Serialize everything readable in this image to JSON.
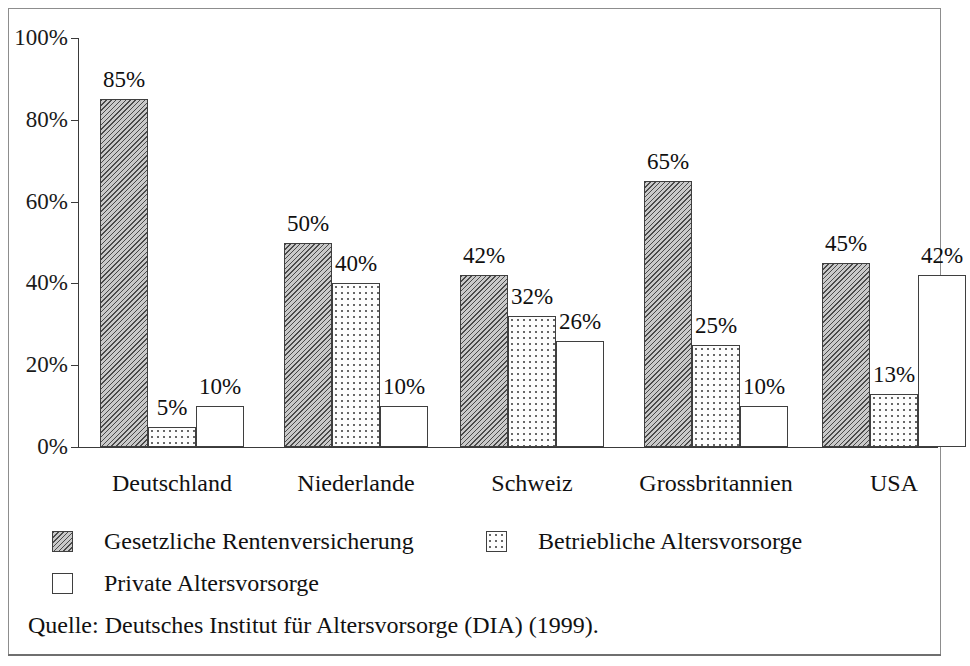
{
  "chart_data": {
    "type": "bar",
    "title": "",
    "subtitle": "",
    "xlabel": "",
    "ylabel": "",
    "ylim": [
      0,
      100
    ],
    "grid": false,
    "legend_position": "bottom",
    "value_suffix": "%",
    "categories": [
      "Deutschland",
      "Niederlande",
      "Schweiz",
      "Grossbritannien",
      "USA"
    ],
    "series": [
      {
        "name": "Gesetzliche Rentenversicherung",
        "pattern": "hatch",
        "values": [
          85,
          50,
          42,
          65,
          45
        ],
        "labels": [
          "85%",
          "50%",
          "42%",
          "65%",
          "45%"
        ]
      },
      {
        "name": "Betriebliche Altersvorsorge",
        "pattern": "dots",
        "values": [
          5,
          40,
          32,
          25,
          13
        ],
        "labels": [
          "5%",
          "40%",
          "32%",
          "25%",
          "13%"
        ]
      },
      {
        "name": "Private Altersvorsorge",
        "pattern": "plain",
        "values": [
          10,
          10,
          26,
          10,
          42
        ],
        "labels": [
          "10%",
          "10%",
          "26%",
          "10%",
          "42%"
        ]
      }
    ],
    "y_ticks": [
      0,
      20,
      40,
      60,
      80,
      100
    ],
    "y_tick_labels": [
      "0%",
      "20%",
      "40%",
      "60%",
      "80%",
      "100%"
    ],
    "source": "Quelle: Deutsches Institut für Altersvorsorge (DIA) (1999)."
  },
  "legend": {
    "entries": [
      {
        "label": "Gesetzliche Rentenversicherung",
        "pattern": "hatch"
      },
      {
        "label": "Betriebliche Altersvorsorge",
        "pattern": "dots"
      },
      {
        "label": "Private Altersvorsorge",
        "pattern": "plain"
      }
    ]
  },
  "colors": {
    "axis": "#3a3a3a",
    "frame": "#8d8d8d",
    "text": "#111111",
    "hatch_fill": "#c9c9c9",
    "hatch_line": "#4a4a4a",
    "dot_fill": "#fdfdfd",
    "dot_color": "#5c5c5c",
    "plain_fill": "#ffffff",
    "bar_border": "#3f3f3f"
  }
}
